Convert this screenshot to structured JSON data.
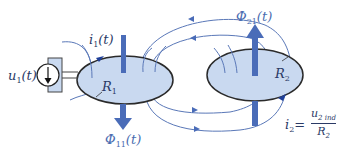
{
  "diagram": {
    "colors": {
      "loop_fill": "#c9d9f0",
      "loop_stroke": "#2a2a2a",
      "field_line": "#5a78b8",
      "flux_arrow": "#4a6cb8",
      "label": "#2b3a66"
    },
    "source": {
      "label": "u",
      "label_sub": "1",
      "label_arg": "(t)",
      "symbol": "voltage-source-arrow-down"
    },
    "loop1": {
      "resistance_label": "R",
      "resistance_sub": "1",
      "current_label": "i",
      "current_sub": "1",
      "current_arg": "(t)",
      "flux_label": "Φ",
      "flux_sub": "11",
      "flux_arg": "(t)",
      "flux_direction": "down"
    },
    "loop2": {
      "resistance_label": "R",
      "resistance_sub": "2",
      "flux_label": "Φ",
      "flux_sub": "21",
      "flux_arg": "(t)",
      "flux_direction": "up",
      "current_label": "i",
      "current_sub": "2",
      "equation_equals": "=",
      "equation_numerator": "u",
      "equation_numerator_sub": "2 ind",
      "equation_denominator": "R",
      "equation_denominator_sub": "2"
    }
  }
}
